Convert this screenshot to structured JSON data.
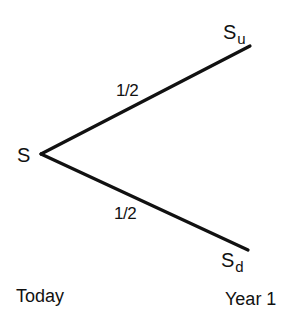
{
  "diagram": {
    "type": "binomial-tree",
    "root": {
      "label": "S"
    },
    "branches": [
      {
        "name": "up",
        "probability": "1/2",
        "node": {
          "base": "S",
          "subscript": "u"
        }
      },
      {
        "name": "down",
        "probability": "1/2",
        "node": {
          "base": "S",
          "subscript": "d"
        }
      }
    ],
    "time_labels": {
      "start": "Today",
      "end": "Year 1"
    }
  }
}
